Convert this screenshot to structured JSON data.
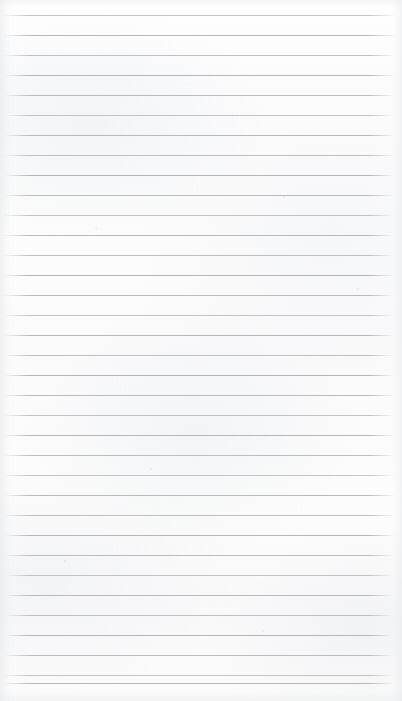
{
  "image": {
    "subject": "blank ruled notebook paper",
    "width": 402,
    "height": 701
  },
  "paper": {
    "background_color": "#fdfdfd",
    "texture": "fibrous uneven scanned paper",
    "content_text": "",
    "has_writing": false
  },
  "rules": {
    "line_color": "#b2b6b9",
    "line_thickness_px": 1,
    "first_line_y": 15,
    "spacing_px": 20,
    "count": 35,
    "left_x": 3,
    "right_x": 395,
    "y_positions": [
      15,
      35,
      55,
      75,
      95,
      115,
      135,
      155,
      175,
      195,
      215,
      235,
      255,
      275,
      295,
      315,
      335,
      355,
      375,
      395,
      415,
      435,
      455,
      475,
      495,
      515,
      535,
      555,
      575,
      595,
      615,
      635,
      655,
      675,
      683
    ]
  },
  "specks": [
    {
      "x": 95,
      "y": 228,
      "size": 2.2
    },
    {
      "x": 357,
      "y": 288,
      "size": 1.8
    },
    {
      "x": 262,
      "y": 630,
      "size": 2.0
    },
    {
      "x": 283,
      "y": 196,
      "size": 1.5
    },
    {
      "x": 150,
      "y": 468,
      "size": 1.6
    },
    {
      "x": 330,
      "y": 520,
      "size": 1.4
    },
    {
      "x": 64,
      "y": 560,
      "size": 1.7
    },
    {
      "x": 210,
      "y": 120,
      "size": 1.3
    }
  ]
}
